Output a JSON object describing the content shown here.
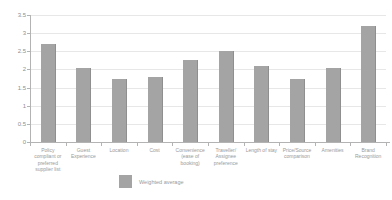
{
  "chart_data": {
    "type": "bar",
    "title": "",
    "xlabel": "",
    "ylabel": "",
    "categories": [
      "Policy compliant or preferred supplier list",
      "Guest Experience",
      "Location",
      "Cost",
      "Convenience (ease of booking)",
      "Traveller/ Assignee preference",
      "Length of stay",
      "Price/Source comparison",
      "Amenities",
      "Brand Recognition"
    ],
    "series": [
      {
        "name": "Weighted average",
        "values": [
          2.7,
          2.05,
          1.75,
          1.8,
          2.25,
          2.5,
          2.1,
          1.75,
          2.05,
          3.2
        ]
      }
    ],
    "ylim": [
      0,
      3.5
    ],
    "ytick_labels": [
      "0",
      "0.5",
      "1",
      "1.5",
      "2",
      "2.5",
      "3",
      "3.5"
    ],
    "grid": "horizontal",
    "legend_position": "bottom"
  },
  "colors": {
    "bar": "#a4a4a4",
    "axis": "#b3b3b3",
    "gridline": "#e7e7e7",
    "text": "#9a9a9a",
    "background": "#ffffff"
  }
}
